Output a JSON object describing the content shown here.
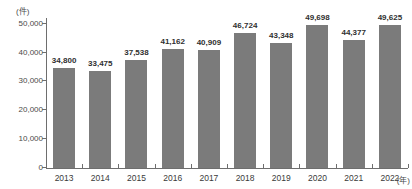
{
  "chart_data": {
    "type": "bar",
    "title": "",
    "xlabel": "(年)",
    "ylabel": "(件)",
    "unit_top_left": "(件)",
    "unit_bottom_right": "(年)",
    "categories": [
      "2013",
      "2014",
      "2015",
      "2016",
      "2017",
      "2018",
      "2019",
      "2020",
      "2021",
      "2022"
    ],
    "values": [
      34800,
      33475,
      37538,
      41162,
      40909,
      46724,
      43348,
      49698,
      44377,
      49625
    ],
    "value_labels": [
      "34,800",
      "33,475",
      "37,538",
      "41,162",
      "40,909",
      "46,724",
      "43,348",
      "49,698",
      "44,377",
      "49,625"
    ],
    "ylim": [
      0,
      52000
    ],
    "yticks": [
      0,
      10000,
      20000,
      30000,
      40000,
      50000
    ],
    "ytick_labels": [
      "0",
      "10,000",
      "20,000",
      "30,000",
      "40,000",
      "50,000"
    ],
    "grid": false,
    "legend": null,
    "bar_color": "#7b7b7b",
    "axis_color": "#6e6e6e",
    "text_color": "#3a3a3a"
  }
}
